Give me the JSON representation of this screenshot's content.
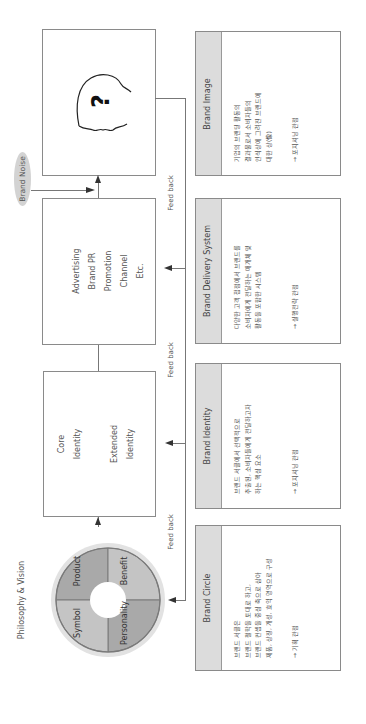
{
  "diagram": {
    "philosophy_label": "Philosophy & Vision",
    "brand_noise": "Brand Noise",
    "feedback_label": "Feed back",
    "circle": {
      "segments": [
        {
          "label": "Product",
          "color": "#a9a9a9"
        },
        {
          "label": "Benefit",
          "color": "#c4c4c4"
        },
        {
          "label": "Personality",
          "color": "#a9a9a9"
        },
        {
          "label": "Symbol",
          "color": "#c4c4c4"
        }
      ],
      "outer_ring_color": "#e2e2e2",
      "divider_color": "#7a7a7a"
    },
    "identity_box": {
      "core": [
        "Core",
        "Identity"
      ],
      "extended": [
        "Extended",
        "Identity"
      ]
    },
    "delivery_box": {
      "lines": [
        "Advertising",
        "Brand PR",
        "Promotion",
        "Channel",
        "Etc."
      ]
    },
    "image_box": {
      "icon": "head-question-icon",
      "glyph": "?"
    }
  },
  "cards": [
    {
      "title": "Brand Image",
      "lines": [
        "기업의 브랜딩 활동의",
        "결과물로서 소비자들의",
        "인식상에 그려진 브랜드에",
        "대한 상(像)"
      ],
      "note": "→ 포지셔닝 관점"
    },
    {
      "title": "Brand Delivery System",
      "lines": [
        "다양한 고객 접점에서 브랜드를",
        "소비자에게 전달하는 매개체 및",
        "활동을 포함한 시스템"
      ],
      "note": "→ 실행전략 관점"
    },
    {
      "title": "Brand Identity",
      "lines": [
        "브랜드 서클에서 선택적으로",
        "추출된, 소비자들에게 전달하고자",
        "하는 핵심 요소"
      ],
      "note": "→ 포지셔닝 관점"
    },
    {
      "title": "Brand Circle",
      "lines": [
        "브랜드 서클은",
        "브랜드 철학을 토대로 하고,",
        "브랜드 컨셉을 중심 축으로 삼아",
        "제품, 상징, 개성, 효익 영역으로 구성"
      ],
      "note": "→ 기획 관점"
    }
  ]
}
